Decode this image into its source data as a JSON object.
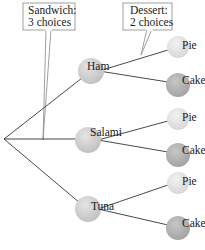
{
  "diagram": {
    "type": "tree",
    "callouts": {
      "sandwich": {
        "line1": "Sandwich:",
        "line2": "3 choices"
      },
      "dessert": {
        "line1": "Dessert:",
        "line2": "2 choices"
      }
    },
    "sandwiches": [
      {
        "label": "Ham",
        "desserts": [
          "Pie",
          "Cake"
        ]
      },
      {
        "label": "Salami",
        "desserts": [
          "Pie",
          "Cake"
        ]
      },
      {
        "label": "Tuna",
        "desserts": [
          "Pie",
          "Cake"
        ]
      }
    ],
    "colors": {
      "sandwich_node": "#d2d2d2",
      "pie_node": "#e6e6e6",
      "cake_node": "#b4b4b4",
      "line": "#333333",
      "callout_border": "#888888"
    }
  },
  "labels": {
    "ham": "Ham",
    "salami": "Salami",
    "tuna": "Tuna",
    "pie": "Pie",
    "cake": "Cake"
  }
}
